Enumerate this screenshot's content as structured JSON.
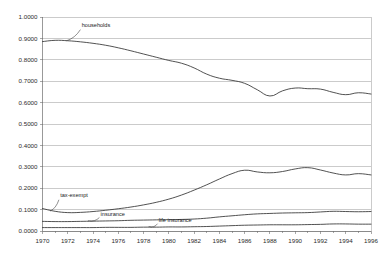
{
  "chart_data": {
    "type": "line",
    "title": "",
    "xlabel": "",
    "ylabel": "",
    "xlim": [
      1970,
      1996
    ],
    "ylim": [
      0.0,
      1.0
    ],
    "grid": true,
    "legend": "inline-annotations",
    "x_tick_labels": [
      "1970",
      "1972",
      "1974",
      "1976",
      "1978",
      "1980",
      "1982",
      "1984",
      "1986",
      "1988",
      "1990",
      "1992",
      "1994",
      "1996"
    ],
    "x_ticks": [
      1970,
      1972,
      1974,
      1976,
      1978,
      1980,
      1982,
      1984,
      1986,
      1988,
      1990,
      1992,
      1994,
      1996
    ],
    "y_tick_labels": [
      "0.0000",
      "0.1000",
      "0.2000",
      "0.3000",
      "0.4000",
      "0.5000",
      "0.6000",
      "0.7000",
      "0.8000",
      "0.9000",
      "1.0000"
    ],
    "y_ticks": [
      0.0,
      0.1,
      0.2,
      0.3,
      0.4,
      0.5,
      0.6,
      0.7,
      0.8,
      0.9,
      1.0
    ],
    "x": [
      1970,
      1971,
      1972,
      1973,
      1974,
      1975,
      1976,
      1977,
      1978,
      1979,
      1980,
      1981,
      1982,
      1983,
      1984,
      1985,
      1986,
      1987,
      1988,
      1989,
      1990,
      1991,
      1992,
      1993,
      1994,
      1995,
      1996
    ],
    "series": [
      {
        "name": "households",
        "label": "households",
        "label_x": 1973.1,
        "label_y": 0.952,
        "leader_from": [
          1973.0,
          0.941
        ],
        "leader_to": [
          1971.9,
          0.889
        ],
        "color": "#333333",
        "values": [
          0.885,
          0.891,
          0.889,
          0.884,
          0.877,
          0.868,
          0.856,
          0.842,
          0.827,
          0.812,
          0.797,
          0.784,
          0.762,
          0.733,
          0.714,
          0.704,
          0.69,
          0.66,
          0.631,
          0.655,
          0.668,
          0.665,
          0.663,
          0.648,
          0.637,
          0.646,
          0.64
        ]
      },
      {
        "name": "tax-exempt",
        "label": "tax-exempt",
        "label_x": 1971.4,
        "label_y": 0.158,
        "leader_from": [
          1971.3,
          0.146
        ],
        "leader_to": [
          1970.6,
          0.093
        ],
        "color": "#333333",
        "values": [
          0.105,
          0.092,
          0.086,
          0.087,
          0.091,
          0.097,
          0.104,
          0.112,
          0.122,
          0.134,
          0.149,
          0.168,
          0.191,
          0.216,
          0.243,
          0.268,
          0.284,
          0.276,
          0.272,
          0.278,
          0.29,
          0.296,
          0.285,
          0.271,
          0.262,
          0.268,
          0.262
        ]
      },
      {
        "name": "insurance",
        "label": "insurance",
        "label_x": 1974.6,
        "label_y": 0.072,
        "leader_from": [
          1974.5,
          0.063
        ],
        "leader_to": [
          1973.6,
          0.048
        ],
        "color": "#333333",
        "values": [
          0.045,
          0.044,
          0.044,
          0.045,
          0.046,
          0.047,
          0.048,
          0.05,
          0.051,
          0.052,
          0.053,
          0.054,
          0.056,
          0.06,
          0.066,
          0.071,
          0.076,
          0.08,
          0.082,
          0.084,
          0.085,
          0.086,
          0.089,
          0.092,
          0.091,
          0.09,
          0.091
        ]
      },
      {
        "name": "life insurance",
        "label": "life insurance",
        "label_x": 1979.2,
        "label_y": 0.042,
        "leader_from": [
          1979.1,
          0.034
        ],
        "leader_to": [
          1978.4,
          0.021
        ],
        "color": "#333333",
        "values": [
          0.016,
          0.016,
          0.016,
          0.016,
          0.016,
          0.017,
          0.017,
          0.017,
          0.018,
          0.018,
          0.019,
          0.019,
          0.02,
          0.021,
          0.023,
          0.025,
          0.027,
          0.028,
          0.029,
          0.029,
          0.029,
          0.03,
          0.031,
          0.033,
          0.033,
          0.032,
          0.032
        ]
      }
    ]
  }
}
